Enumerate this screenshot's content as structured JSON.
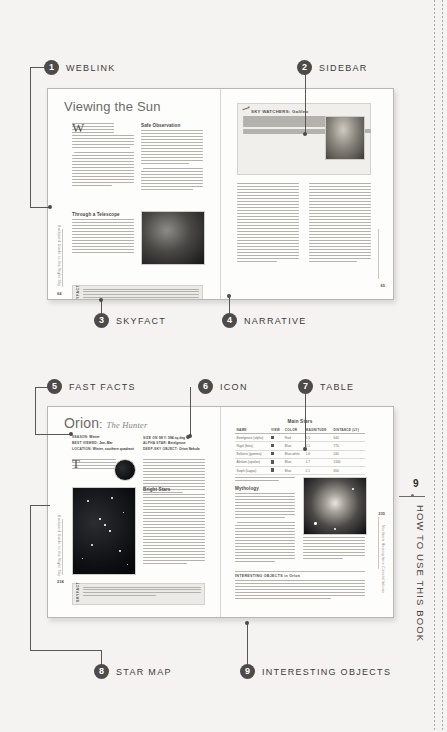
{
  "folio": {
    "page_number": "9",
    "running_head": "HOW TO USE THIS BOOK"
  },
  "callouts": [
    {
      "num": "1",
      "label": "WEBLINK"
    },
    {
      "num": "2",
      "label": "SIDEBAR"
    },
    {
      "num": "3",
      "label": "SKYFACT"
    },
    {
      "num": "4",
      "label": "NARRATIVE"
    },
    {
      "num": "5",
      "label": "FAST FACTS"
    },
    {
      "num": "6",
      "label": "ICON"
    },
    {
      "num": "7",
      "label": "TABLE"
    },
    {
      "num": "8",
      "label": "STAR MAP"
    },
    {
      "num": "9",
      "label": "INTERESTING OBJECTS"
    }
  ],
  "spread_top": {
    "title": "Viewing the Sun",
    "headings": {
      "safe": "Safe Observation",
      "telescope": "Through a Telescope"
    },
    "sidebar": {
      "heading": "SKY WATCHERS: Galileo"
    },
    "skyfact": {
      "label": "SKYFACT",
      "text": "You don't need an advanced degree in astrophysics to make important discoveries about the Sun. Some of the most important findings about the Sun, including the sunspot cycle and the connection between sunspots and solar storms, have been made by amateur astronomers."
    },
    "margin_left": "Backyard Guide to the Night Sky",
    "page_left": "64",
    "page_right": "65"
  },
  "spread_bottom": {
    "title_main": "Orion",
    "title_sub": "The Hunter",
    "fast_facts": [
      {
        "key": "SEASON:",
        "value": "Winter"
      },
      {
        "key": "BEST VIEWED:",
        "value": "Jan–Mar"
      },
      {
        "key": "LOCATION:",
        "value": "Winter, southern quadrant"
      },
      {
        "key": "SIZE ON SKY:",
        "value": "594 sq deg"
      },
      {
        "key": "ALPHA STAR:",
        "value": "Betelgeuse"
      },
      {
        "key": "DEEP-SKY OBJECT:",
        "value": "Orion Nebula"
      }
    ],
    "headings": {
      "bright": "Bright Stars",
      "mythology": "Mythology"
    },
    "table": {
      "title": "Main Stars",
      "columns": [
        "NAME",
        "VIEW",
        "COLOR",
        "MAGNITUDE",
        "DISTANCE (LY)"
      ],
      "rows": [
        [
          "Betelgeuse (alpha)",
          "",
          "Red",
          "0.5",
          "640"
        ],
        [
          "Rigel (beta)",
          "",
          "Blue",
          "0.1",
          "770"
        ],
        [
          "Bellatrix (gamma)",
          "",
          "Blue-white",
          "1.6",
          "240"
        ],
        [
          "Alnilam (epsilon)",
          "",
          "Blue",
          "1.7",
          "1340"
        ],
        [
          "Saiph (kappa)",
          "",
          "Blue",
          "2.1",
          "650"
        ]
      ]
    },
    "interesting_objects": {
      "heading": "INTERESTING OBJECTS in Orion"
    },
    "skyfact": {
      "label": "SKYFACT",
      "text": "Draw a analog the constellations to work for easy star objects make a constellation three times in the field, for example, including the cosmic question time side. “Can you find the charts of the Pleiades. Or hunt the circle of Orion?”"
    },
    "margin_left": "Backyard Guide to the Night Sky",
    "margin_right": "Northern Hemisphere Constellations",
    "page_left": "234",
    "page_right": "235"
  },
  "colors": {
    "bullet": "#4d4b47",
    "paper": "#fdfdfc",
    "background": "#f4f3f1"
  }
}
